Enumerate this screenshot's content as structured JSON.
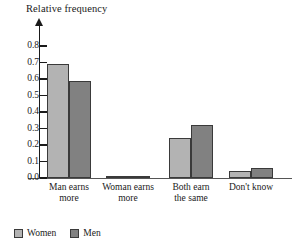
{
  "chart_data": {
    "type": "bar",
    "title": "",
    "ylabel": "Relative frequency",
    "xlabel": "",
    "ylim": [
      0.0,
      0.85
    ],
    "grid": false,
    "legend_position": "bottom-left",
    "ytick_labels": [
      "0.0",
      "0.1",
      "0.2",
      "0.3",
      "0.4",
      "0.5",
      "0.6",
      "0.7",
      "0.8"
    ],
    "ytick_values": [
      0.0,
      0.1,
      0.2,
      0.3,
      0.4,
      0.5,
      0.6,
      0.7,
      0.8
    ],
    "categories": [
      "Man earns\nmore",
      "Woman earns\nmore",
      "Both earn\nthe same",
      "Don't know"
    ],
    "series": [
      {
        "name": "Women",
        "color": "#b3b3b3",
        "values": [
          0.69,
          0.01,
          0.24,
          0.04
        ]
      },
      {
        "name": "Men",
        "color": "#818181",
        "values": [
          0.59,
          0.01,
          0.32,
          0.06
        ]
      }
    ]
  },
  "axis_title": "Relative frequency",
  "legend": {
    "items": [
      {
        "label": "Women",
        "swatch": "women-swatch"
      },
      {
        "label": "Men",
        "swatch": "men-swatch"
      }
    ]
  },
  "categories": [
    {
      "line1": "Man earns",
      "line2": "more"
    },
    {
      "line1": "Woman earns",
      "line2": "more"
    },
    {
      "line1": "Both earn",
      "line2": "the same"
    },
    {
      "line1": "Don't know",
      "line2": ""
    }
  ]
}
